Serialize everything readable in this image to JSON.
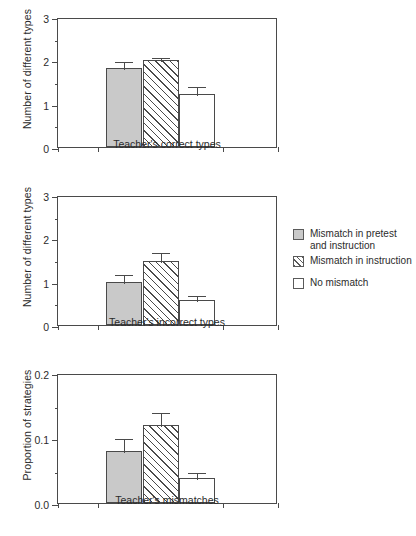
{
  "chart_data": [
    {
      "type": "bar",
      "title": "",
      "xlabel": "Teacher's correct types",
      "ylabel": "Number of different types",
      "ylim": [
        0,
        3
      ],
      "yticks": [
        0,
        1,
        2,
        3
      ],
      "ytick_labels": [
        "0",
        "1",
        "2",
        "3"
      ],
      "yminor_step": 0.5,
      "grid": false,
      "categories": [
        "Mismatch in pretest and instruction",
        "Mismatch in instruction",
        "No mismatch"
      ],
      "values": [
        1.83,
        2.0,
        1.22
      ],
      "errors": [
        0.17,
        0.11,
        0.21
      ]
    },
    {
      "type": "bar",
      "title": "",
      "xlabel": "Teacher's incorrect types",
      "ylabel": "Number of different types",
      "ylim": [
        0,
        3
      ],
      "yticks": [
        0,
        1,
        2,
        3
      ],
      "ytick_labels": [
        "0",
        "1",
        "2",
        "3"
      ],
      "yminor_step": 0.5,
      "grid": false,
      "categories": [
        "Mismatch in pretest and instruction",
        "Mismatch in instruction",
        "No mismatch"
      ],
      "values": [
        1.0,
        1.48,
        0.58
      ],
      "errors": [
        0.19,
        0.23,
        0.13
      ]
    },
    {
      "type": "bar",
      "title": "",
      "xlabel": "Teacher's mismatches",
      "ylabel": "Proportion of strategies",
      "ylim": [
        0,
        0.2
      ],
      "yticks": [
        0,
        0.1,
        0.2
      ],
      "ytick_labels": [
        "0.0",
        "0.1",
        "0.2"
      ],
      "yminor_step": 0.05,
      "grid": false,
      "categories": [
        "Mismatch in pretest and instruction",
        "Mismatch in instruction",
        "No mismatch"
      ],
      "values": [
        0.08,
        0.12,
        0.038
      ],
      "errors": [
        0.021,
        0.021,
        0.011
      ]
    }
  ],
  "legend": {
    "position": "right",
    "items": [
      {
        "label_line1": "Mismatch in pretest",
        "label_line2": "and instruction",
        "style": "solid",
        "swatch_name": "legend-swatch-solid-gray"
      },
      {
        "label_line1": "Mismatch in instruction",
        "label_line2": "",
        "style": "hatch",
        "swatch_name": "legend-swatch-hatched"
      },
      {
        "label_line1": "No mismatch",
        "label_line2": "",
        "style": "open",
        "swatch_name": "legend-swatch-open-white"
      }
    ]
  },
  "colors": {
    "bar_fill_gray": "#c9c9c9",
    "bar_outline": "#4a4a4a",
    "hatch_line": "#4a4a4a",
    "text": "#2b2b2b",
    "background": "#ffffff"
  }
}
